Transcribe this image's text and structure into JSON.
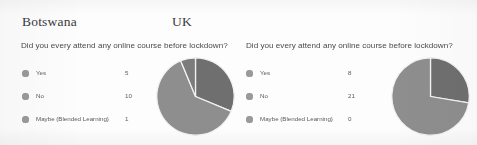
{
  "document": {
    "background_color": "#fdfdfd",
    "pie_colors": {
      "yes": "#6f6f6f",
      "no": "#8e8e8e",
      "maybe": "#7c7c7c",
      "separator": "#f2f2f2",
      "legend_marker": "#9a9a9a"
    }
  },
  "panels": [
    {
      "title": "Botswana",
      "question": "Did you every attend any online course before lockdown?",
      "legend": [
        {
          "label": "Yes",
          "value": "5"
        },
        {
          "label": "No",
          "value": "10"
        },
        {
          "label": "Maybe (Blended Learning)",
          "value": "1"
        }
      ]
    },
    {
      "title": "UK",
      "question": "Did you every attend any online course before lockdown?",
      "legend": [
        {
          "label": "Yes",
          "value": "8"
        },
        {
          "label": "No",
          "value": "21"
        },
        {
          "label": "Maybe (Blended Learning)",
          "value": "0"
        }
      ]
    }
  ],
  "chart_data": [
    {
      "type": "pie",
      "title": "Botswana",
      "subtitle": "Did you every attend any online course before lockdown?",
      "categories": [
        "Yes",
        "No",
        "Maybe (Blended Learning)"
      ],
      "values": [
        5,
        10,
        1
      ],
      "total": 16,
      "percentages": [
        31.25,
        62.5,
        6.25
      ],
      "colors": [
        "#6f6f6f",
        "#8e8e8e",
        "#7c7c7c"
      ],
      "legend": "left",
      "start_angle_deg": 0,
      "direction": "clockwise",
      "xlabel": "",
      "ylabel": ""
    },
    {
      "type": "pie",
      "title": "UK",
      "subtitle": "Did you every attend any online course before lockdown?",
      "categories": [
        "Yes",
        "No",
        "Maybe (Blended Learning)"
      ],
      "values": [
        8,
        21,
        0
      ],
      "total": 29,
      "percentages": [
        27.59,
        72.41,
        0
      ],
      "colors": [
        "#6f6f6f",
        "#8e8e8e",
        "#7c7c7c"
      ],
      "legend": "left",
      "start_angle_deg": 0,
      "direction": "clockwise",
      "xlabel": "",
      "ylabel": ""
    }
  ]
}
